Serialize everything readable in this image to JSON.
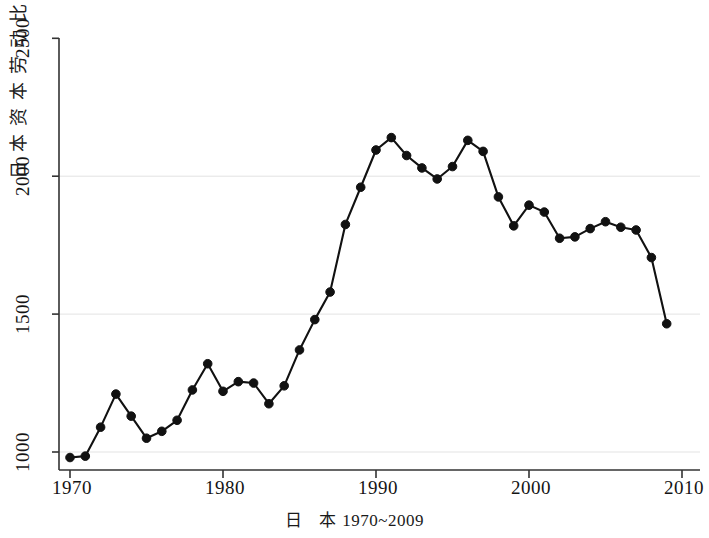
{
  "chart_data": {
    "type": "line",
    "title": "",
    "subtitle": "",
    "caption_cjk": "日 本",
    "caption_range": "1970~2009",
    "ylabel": "日本资本劳动比",
    "ylabel_chars": [
      "日",
      "本",
      "资",
      "本",
      "劳",
      "动",
      "比"
    ],
    "xlabel": "",
    "xlim": [
      1969,
      2010.5
    ],
    "ylim": [
      900,
      2560
    ],
    "xticks": [
      1970,
      1980,
      1990,
      2000,
      2010
    ],
    "xtick_labels": [
      "1970",
      "1980",
      "1990",
      "2000",
      "2010"
    ],
    "yticks": [
      1000,
      1500,
      2000,
      2500
    ],
    "ytick_labels": [
      "1000",
      "1500",
      "2000",
      "2500"
    ],
    "grid": "horizontal",
    "gridlines_at": [
      1000,
      1500,
      2000
    ],
    "legend": "none",
    "marker": "filled-circle",
    "line_color": "#111111",
    "marker_color": "#111111",
    "grid_color": "#e3e3e3",
    "axis_color": "#333333",
    "x": [
      1970,
      1971,
      1972,
      1973,
      1974,
      1975,
      1976,
      1977,
      1978,
      1979,
      1980,
      1981,
      1982,
      1983,
      1984,
      1985,
      1986,
      1987,
      1988,
      1989,
      1990,
      1991,
      1992,
      1993,
      1994,
      1995,
      1996,
      1997,
      1998,
      1999,
      2000,
      2001,
      2002,
      2003,
      2004,
      2005,
      2006,
      2007,
      2008,
      2009
    ],
    "values": [
      980,
      985,
      1090,
      1210,
      1130,
      1050,
      1075,
      1115,
      1225,
      1320,
      1220,
      1255,
      1250,
      1175,
      1240,
      1370,
      1480,
      1580,
      1825,
      1960,
      2095,
      2140,
      2075,
      2030,
      1990,
      2035,
      2130,
      2090,
      1925,
      1820,
      1895,
      1870,
      1775,
      1780,
      1810,
      1835,
      1815,
      1805,
      1705,
      1465
    ],
    "series": [
      {
        "name": "日本资本劳动比",
        "values": [
          980,
          985,
          1090,
          1210,
          1130,
          1050,
          1075,
          1115,
          1225,
          1320,
          1220,
          1255,
          1250,
          1175,
          1240,
          1370,
          1480,
          1580,
          1825,
          1960,
          2095,
          2140,
          2075,
          2030,
          1990,
          2035,
          2130,
          2090,
          1925,
          1820,
          1895,
          1870,
          1775,
          1780,
          1810,
          1835,
          1815,
          1805,
          1705,
          1465
        ]
      }
    ]
  }
}
